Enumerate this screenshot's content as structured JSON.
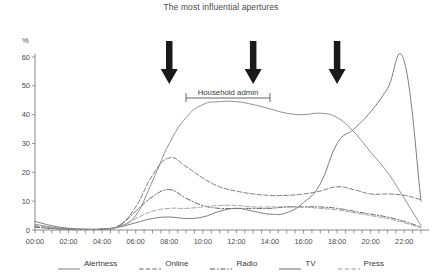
{
  "chart_data": {
    "type": "line",
    "title": "The most influential apertures",
    "xlabel": "",
    "ylabel": "%",
    "ylim": [
      0,
      60
    ],
    "yticks": [
      0,
      10,
      20,
      30,
      40,
      50,
      60
    ],
    "grid": false,
    "legend_position": "bottom",
    "x": [
      "00:00",
      "01:00",
      "02:00",
      "03:00",
      "04:00",
      "05:00",
      "06:00",
      "07:00",
      "08:00",
      "09:00",
      "10:00",
      "11:00",
      "12:00",
      "13:00",
      "14:00",
      "15:00",
      "16:00",
      "17:00",
      "18:00",
      "19:00",
      "20:00",
      "21:00",
      "22:00",
      "23:00"
    ],
    "xtick_labels": [
      "00:00",
      "02:00",
      "04:00",
      "06:00",
      "08:00",
      "10:00",
      "12:00",
      "14:00",
      "16:00",
      "18:00",
      "20:00",
      "22:00"
    ],
    "series": [
      {
        "name": "Alertness",
        "style": "solid",
        "color": "#8a8a8a",
        "values": [
          2.0,
          1.0,
          0.4,
          0.2,
          0.3,
          1.2,
          5.0,
          17.0,
          30.0,
          39.0,
          43.5,
          44.5,
          44.5,
          43.5,
          42.0,
          40.5,
          40.0,
          40.5,
          39.0,
          34.0,
          27.0,
          20.0,
          11.0,
          1.5
        ]
      },
      {
        "name": "Online",
        "style": "dashed",
        "color": "#6e6e6e",
        "values": [
          1.2,
          0.6,
          0.3,
          0.2,
          0.3,
          1.5,
          8.0,
          19.0,
          25.0,
          22.0,
          18.0,
          15.0,
          13.5,
          12.5,
          12.0,
          12.0,
          12.5,
          13.5,
          15.0,
          14.0,
          12.5,
          12.5,
          12.0,
          10.5
        ]
      },
      {
        "name": "Radio",
        "style": "dash-dot",
        "color": "#555555",
        "values": [
          1.0,
          0.5,
          0.3,
          0.2,
          0.3,
          1.5,
          6.5,
          11.5,
          14.0,
          11.0,
          8.5,
          7.5,
          7.5,
          7.5,
          7.5,
          8.0,
          8.0,
          8.0,
          7.5,
          6.5,
          5.5,
          4.5,
          3.0,
          1.0
        ]
      },
      {
        "name": "TV",
        "style": "solid",
        "color": "#777777",
        "values": [
          3.0,
          1.5,
          0.6,
          0.3,
          0.4,
          1.0,
          2.5,
          4.0,
          4.5,
          4.0,
          4.5,
          6.5,
          7.5,
          6.5,
          5.5,
          6.0,
          9.5,
          16.0,
          30.0,
          35.0,
          41.0,
          49.0,
          58.5,
          10.0
        ]
      },
      {
        "name": "Press",
        "style": "dashed",
        "color": "#9a9a9a",
        "values": [
          1.5,
          0.7,
          0.3,
          0.2,
          0.3,
          1.2,
          4.0,
          6.5,
          7.5,
          7.5,
          8.0,
          8.5,
          8.5,
          8.0,
          8.0,
          8.0,
          8.0,
          7.5,
          7.0,
          6.0,
          5.0,
          4.0,
          2.5,
          0.8
        ]
      }
    ],
    "annotations": [
      {
        "type": "bracket",
        "label": "Household admin",
        "x_start": "09:00",
        "x_end": "14:00"
      },
      {
        "type": "arrow",
        "label": "arrow-1",
        "x": "08:00"
      },
      {
        "type": "arrow",
        "label": "arrow-2",
        "x": "13:00"
      },
      {
        "type": "arrow",
        "label": "arrow-3",
        "x": "18:00"
      }
    ]
  },
  "legend": {
    "items": [
      {
        "label": "Alertness"
      },
      {
        "label": "Online"
      },
      {
        "label": "Radio"
      },
      {
        "label": "TV"
      },
      {
        "label": "Press"
      }
    ]
  }
}
